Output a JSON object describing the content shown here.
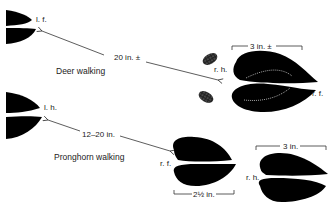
{
  "deer": {
    "caption": "Deer walking",
    "left_front_label": "l. f.",
    "right_hind_label": "r. h.",
    "right_front_label": "r. f.",
    "stride_label": "20 in. ±",
    "track_length_label": "3 in. ±"
  },
  "pronghorn": {
    "caption": "Pronghorn walking",
    "left_hind_label": "l. h.",
    "right_front_label": "r. f.",
    "right_hind_label": "r. h.",
    "stride_label": "12–20 in.",
    "front_width_label": "2½ in.",
    "hind_length_label": "3 in."
  },
  "colors": {
    "ink": "#000000",
    "dew": "#555555",
    "line": "#333333"
  }
}
